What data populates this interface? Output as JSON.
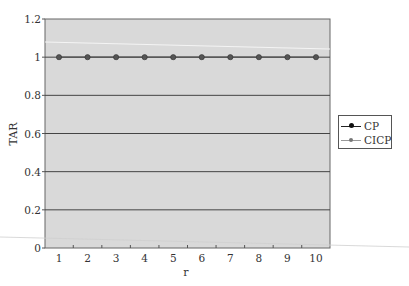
{
  "chart_data": {
    "type": "line",
    "title": "",
    "xlabel": "r",
    "ylabel": "TAR",
    "x": [
      1,
      2,
      3,
      4,
      5,
      6,
      7,
      8,
      9,
      10
    ],
    "series": [
      {
        "name": "CP",
        "values": [
          1,
          1,
          1,
          1,
          1,
          1,
          1,
          1,
          1,
          1
        ],
        "color": "#222222",
        "marker": "circle"
      },
      {
        "name": "CICP",
        "values": [
          1,
          1,
          1,
          1,
          1,
          1,
          1,
          1,
          1,
          1
        ],
        "color": "#888888",
        "marker": "circle"
      }
    ],
    "ylim": [
      0,
      1.2
    ],
    "yticks": [
      "0",
      "0.2",
      "0.4",
      "0.6",
      "0.8",
      "1",
      "1.2"
    ],
    "xticks": [
      "1",
      "2",
      "3",
      "4",
      "5",
      "6",
      "7",
      "8",
      "9",
      "10"
    ],
    "grid": true,
    "legend_position": "right",
    "plot_background": "#d9d9d9"
  },
  "legend": {
    "items": [
      {
        "label": "CP",
        "color": "#222222"
      },
      {
        "label": "CICP",
        "color": "#888888"
      }
    ]
  }
}
